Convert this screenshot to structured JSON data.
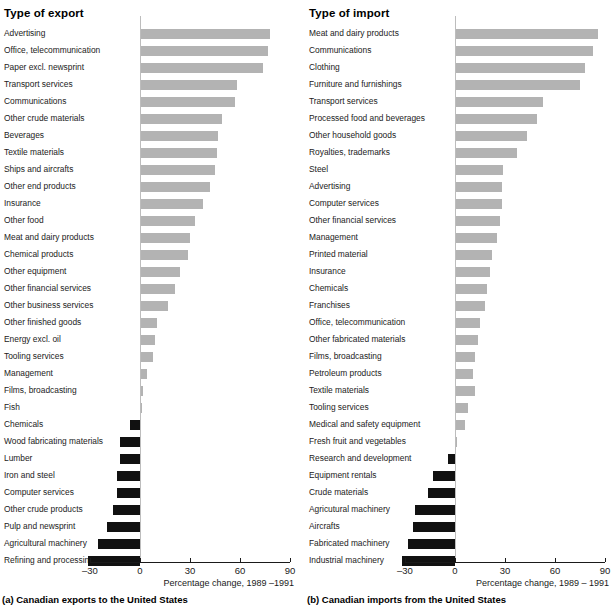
{
  "chart_data": [
    {
      "type": "bar",
      "orientation": "horizontal",
      "title": "Type of export",
      "caption": "(a) Canadian exports to the United States",
      "xlabel": "Percentage change, 1989 –1991",
      "ylabel": "",
      "xlim": [
        -40,
        90
      ],
      "xticks": [
        -30,
        0,
        30,
        60,
        90
      ],
      "xticklabels": [
        "–30",
        "0",
        "30",
        "60",
        "90"
      ],
      "grid": false,
      "legend": "none",
      "positive_color": "#b3b3b3",
      "negative_color": "#111111",
      "categories": [
        "Advertising",
        "Office, telecommunication",
        "Paper excl. newsprint",
        "Transport services",
        "Communications",
        "Other crude materials",
        "Beverages",
        "Textile materials",
        "Ships and aircrafts",
        "Other end products",
        "Insurance",
        "Other food",
        "Meat and dairy products",
        "Chemical products",
        "Other equipment",
        "Other financial services",
        "Other business services",
        "Other finished goods",
        "Energy excl. oil",
        "Tooling services",
        "Management",
        "Films, broadcasting",
        "Fish",
        "Chemicals",
        "Wood fabricating materials",
        "Lumber",
        "Iron and steel",
        "Computer services",
        "Other crude products",
        "Pulp and newsprint",
        "Agricultural machinery",
        "Refining and processing"
      ],
      "values": [
        78,
        77,
        74,
        58,
        57,
        49,
        47,
        46,
        45,
        42,
        38,
        33,
        30,
        29,
        24,
        21,
        17,
        10,
        9,
        8,
        4,
        2,
        1,
        -6,
        -12,
        -12,
        -14,
        -14,
        -16,
        -20,
        -25,
        -31
      ]
    },
    {
      "type": "bar",
      "orientation": "horizontal",
      "title": "Type of import",
      "caption": "(b) Canadian imports from the United States",
      "xlabel": "Percentage change, 1989 – 1991",
      "ylabel": "",
      "xlim": [
        -40,
        90
      ],
      "xticks": [
        -30,
        0,
        30,
        60,
        90
      ],
      "xticklabels": [
        "–30",
        "0",
        "30",
        "60",
        "90"
      ],
      "grid": false,
      "legend": "none",
      "positive_color": "#b3b3b3",
      "negative_color": "#111111",
      "categories": [
        "Meat and dairy products",
        "Communications",
        "Clothing",
        "Furniture and furnishings",
        "Transport services",
        "Processed food and beverages",
        "Other household goods",
        "Royalties, trademarks",
        "Steel",
        "Advertising",
        "Computer services",
        "Other financial services",
        "Management",
        "Printed material",
        "Insurance",
        "Chemicals",
        "Franchises",
        "Office, telecommunication",
        "Other fabricated materials",
        "Films, broadcasting",
        "Petroleum products",
        "Textile materials",
        "Tooling services",
        "Medical and safety equipment",
        "Fresh fruit and vegetables",
        "Research and development",
        "Equipment rentals",
        "Crude materials",
        "Agricutural machinery",
        "Aircrafts",
        "Fabricated machinery",
        "Industrial machinery"
      ],
      "values": [
        86,
        83,
        78,
        75,
        53,
        49,
        43,
        37,
        29,
        28,
        28,
        27,
        25,
        22,
        21,
        19,
        18,
        15,
        14,
        12,
        11,
        12,
        8,
        6,
        1,
        -4,
        -13,
        -16,
        -24,
        -25,
        -28,
        -32
      ]
    }
  ]
}
